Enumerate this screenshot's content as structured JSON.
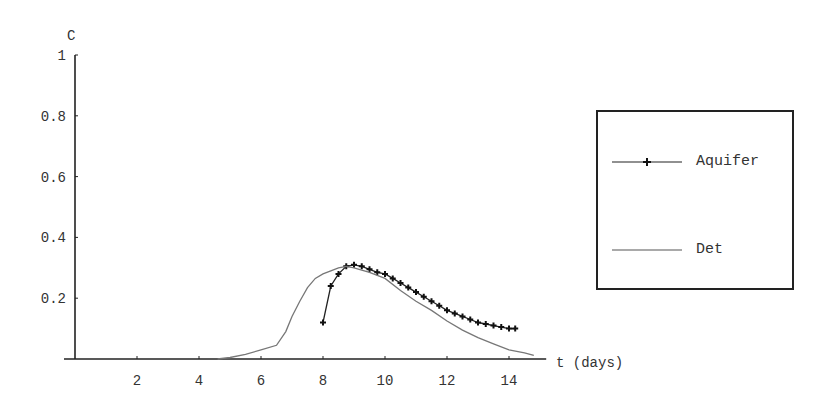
{
  "chart_data": {
    "type": "line",
    "title": "",
    "xlabel": "t (days)",
    "ylabel": "C",
    "xlim": [
      0,
      15.2
    ],
    "ylim": [
      0,
      1
    ],
    "xticks": [
      2,
      4,
      6,
      8,
      10,
      12,
      14
    ],
    "yticks": [
      0.2,
      0.4,
      0.6,
      0.8,
      1
    ],
    "ytick_labels": [
      "0.2",
      "0.4",
      "0.6",
      "0.8",
      "1"
    ],
    "grid": false,
    "legend_position": "right",
    "series": [
      {
        "name": "Aquifer",
        "style": "line-with-markers",
        "color": "#222222",
        "x": [
          8.0,
          8.25,
          8.5,
          8.75,
          9.0,
          9.25,
          9.5,
          9.75,
          10.0,
          10.25,
          10.5,
          10.75,
          11.0,
          11.25,
          11.5,
          11.75,
          12.0,
          12.25,
          12.5,
          12.75,
          13.0,
          13.25,
          13.5,
          13.75,
          14.0,
          14.2
        ],
        "y": [
          0.12,
          0.24,
          0.28,
          0.305,
          0.31,
          0.305,
          0.295,
          0.285,
          0.28,
          0.265,
          0.25,
          0.235,
          0.22,
          0.205,
          0.19,
          0.175,
          0.16,
          0.15,
          0.14,
          0.13,
          0.12,
          0.115,
          0.11,
          0.105,
          0.1,
          0.1
        ]
      },
      {
        "name": "Det",
        "style": "line",
        "color": "#777777",
        "x": [
          4.6,
          5.0,
          5.5,
          6.0,
          6.5,
          6.8,
          7.0,
          7.25,
          7.5,
          7.75,
          8.0,
          8.25,
          8.5,
          8.75,
          9.0,
          9.5,
          10.0,
          10.5,
          11.0,
          11.5,
          12.0,
          12.5,
          13.0,
          13.5,
          14.0,
          14.5,
          14.8
        ],
        "y": [
          0.0,
          0.005,
          0.015,
          0.03,
          0.045,
          0.09,
          0.14,
          0.19,
          0.235,
          0.265,
          0.28,
          0.29,
          0.3,
          0.305,
          0.3,
          0.285,
          0.265,
          0.225,
          0.19,
          0.16,
          0.125,
          0.095,
          0.07,
          0.05,
          0.03,
          0.02,
          0.012
        ]
      }
    ]
  },
  "axes": {
    "y_label": "C",
    "x_label": "t (days)"
  },
  "legend": {
    "items": [
      {
        "label": "Aquifer"
      },
      {
        "label": "Det"
      }
    ]
  }
}
